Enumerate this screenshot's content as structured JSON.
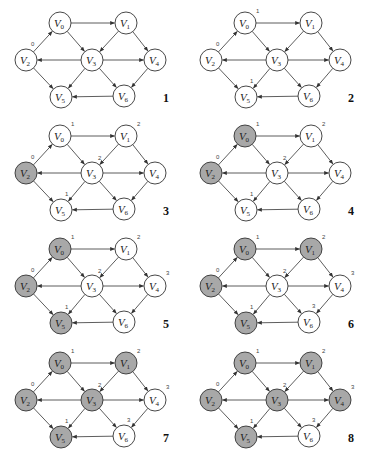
{
  "figure": {
    "node_radius": 11,
    "colors": {
      "visited_fill": "#a8a8a8",
      "unvisited_fill": "#ffffff",
      "stroke": "#333333",
      "edge": "#333333",
      "label": "#222222",
      "distance": "#444444"
    },
    "nodes": [
      {
        "id": "V0",
        "label": "V",
        "sub": "0",
        "x": 60,
        "y": 23,
        "dist_dx": 11,
        "dist_dy": -10
      },
      {
        "id": "V1",
        "label": "V",
        "sub": "1",
        "x": 126,
        "y": 23,
        "dist_dx": 11,
        "dist_dy": -10
      },
      {
        "id": "V2",
        "label": "V",
        "sub": "2",
        "x": 26,
        "y": 60,
        "dist_dx": 5,
        "dist_dy": -14
      },
      {
        "id": "V3",
        "label": "V",
        "sub": "3",
        "x": 92,
        "y": 60,
        "dist_dx": 6,
        "dist_dy": -13
      },
      {
        "id": "V4",
        "label": "V",
        "sub": "4",
        "x": 155,
        "y": 60,
        "dist_dx": 11,
        "dist_dy": -11
      },
      {
        "id": "V5",
        "label": "V",
        "sub": "5",
        "x": 61,
        "y": 97,
        "dist_dx": 4,
        "dist_dy": -14
      },
      {
        "id": "V6",
        "label": "V",
        "sub": "6",
        "x": 124,
        "y": 96,
        "dist_dx": 3,
        "dist_dy": -14
      }
    ],
    "edges": [
      {
        "from": "V2",
        "to": "V0"
      },
      {
        "from": "V0",
        "to": "V1"
      },
      {
        "from": "V0",
        "to": "V3"
      },
      {
        "from": "V1",
        "to": "V3"
      },
      {
        "from": "V1",
        "to": "V4"
      },
      {
        "from": "V3",
        "to": "V2"
      },
      {
        "from": "V3",
        "to": "V4"
      },
      {
        "from": "V2",
        "to": "V5"
      },
      {
        "from": "V3",
        "to": "V5"
      },
      {
        "from": "V3",
        "to": "V6"
      },
      {
        "from": "V4",
        "to": "V6"
      },
      {
        "from": "V6",
        "to": "V5"
      }
    ],
    "panels": [
      {
        "number": "1",
        "x": 0,
        "y": 0,
        "visited": [],
        "distances": {
          "V2": "0"
        }
      },
      {
        "number": "2",
        "x": 185,
        "y": 0,
        "visited": [],
        "distances": {
          "V2": "0",
          "V0": "1",
          "V5": "1"
        }
      },
      {
        "number": "3",
        "x": 0,
        "y": 113,
        "visited": [
          "V2"
        ],
        "distances": {
          "V2": "0",
          "V0": "1",
          "V5": "1",
          "V1": "2",
          "V3": "2"
        }
      },
      {
        "number": "4",
        "x": 185,
        "y": 113,
        "visited": [
          "V2",
          "V0"
        ],
        "distances": {
          "V2": "0",
          "V0": "1",
          "V5": "1",
          "V1": "2",
          "V3": "2"
        }
      },
      {
        "number": "5",
        "x": 0,
        "y": 226,
        "visited": [
          "V2",
          "V0",
          "V5"
        ],
        "distances": {
          "V2": "0",
          "V0": "1",
          "V5": "1",
          "V1": "2",
          "V3": "2",
          "V4": "3"
        }
      },
      {
        "number": "6",
        "x": 185,
        "y": 226,
        "visited": [
          "V2",
          "V0",
          "V5",
          "V1"
        ],
        "distances": {
          "V2": "0",
          "V0": "1",
          "V5": "1",
          "V1": "2",
          "V3": "2",
          "V4": "3",
          "V6": "3"
        }
      },
      {
        "number": "7",
        "x": 0,
        "y": 340,
        "visited": [
          "V2",
          "V0",
          "V5",
          "V1",
          "V3"
        ],
        "distances": {
          "V2": "0",
          "V0": "1",
          "V5": "1",
          "V1": "2",
          "V3": "2",
          "V4": "3",
          "V6": "3"
        }
      },
      {
        "number": "8",
        "x": 185,
        "y": 340,
        "visited": [
          "V2",
          "V0",
          "V5",
          "V1",
          "V3",
          "V4"
        ],
        "distances": {
          "V2": "0",
          "V0": "1",
          "V5": "1",
          "V1": "2",
          "V3": "2",
          "V4": "3",
          "V6": "3"
        }
      }
    ],
    "panel_number_pos": {
      "x": 163,
      "y": 91
    }
  }
}
